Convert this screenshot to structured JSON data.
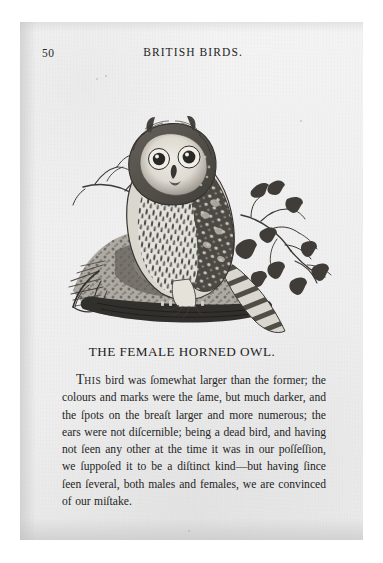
{
  "page": {
    "folio": "50",
    "running_title": "BRITISH BIRDS.",
    "caption": "THE FEMALE HORNED OWL."
  },
  "body": {
    "initial_letter": "T",
    "initial_smallcaps": "HIS",
    "paragraph": " bird was ſomewhat larger than the former; the colours and marks were the ſame, but much darker, and the ſpots on the breaſt larger and more numerous; the ears were not diſcernible; being a dead bird, and having not ſeen any other at the time it was in our poſſeſſion, we ſuppoſed it to be a diſtinct kind—but having ſince ſeen ſeveral, both males and females, we are convinced of our miſtake."
  },
  "illustration": {
    "title": "female-horned-owl-woodcut",
    "description": "Wood engraving of a horned owl perched on a mossy stump with a leafy branch at right",
    "ink_color": "#2b2b2b",
    "paper_color": "#f0f0f0"
  }
}
